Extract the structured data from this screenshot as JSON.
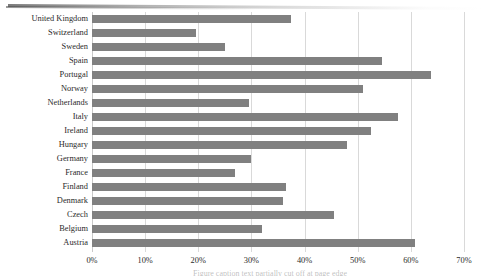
{
  "chart_data": {
    "type": "bar",
    "orientation": "horizontal",
    "title": "",
    "subtitle": "",
    "xlabel": "",
    "ylabel": "",
    "xlim": [
      0,
      70
    ],
    "ylim": null,
    "grid": true,
    "grid_axis": "x",
    "legend": false,
    "legend_position": "none",
    "bar_color": "#808080",
    "gridline_color": "#d9d9d9",
    "tick_suffix": "%",
    "xticks": [
      0,
      10,
      20,
      30,
      40,
      50,
      60,
      70
    ],
    "xtick_labels": [
      "0%",
      "10%",
      "20%",
      "30%",
      "40%",
      "50%",
      "60%",
      "70%"
    ],
    "categories": [
      "United Kingdom",
      "Switzerland",
      "Sweden",
      "Spain",
      "Portugal",
      "Norway",
      "Netherlands",
      "Italy",
      "Ireland",
      "Hungary",
      "Germany",
      "France",
      "Finland",
      "Denmark",
      "Czech",
      "Belgium",
      "Austria"
    ],
    "values": [
      37.5,
      19.5,
      25.0,
      54.5,
      63.8,
      51.0,
      29.5,
      57.5,
      52.5,
      48.0,
      30.0,
      27.0,
      36.5,
      36.0,
      45.5,
      32.0,
      60.8
    ]
  },
  "bottom_caption": "Figure caption text partially cut off at page edge"
}
